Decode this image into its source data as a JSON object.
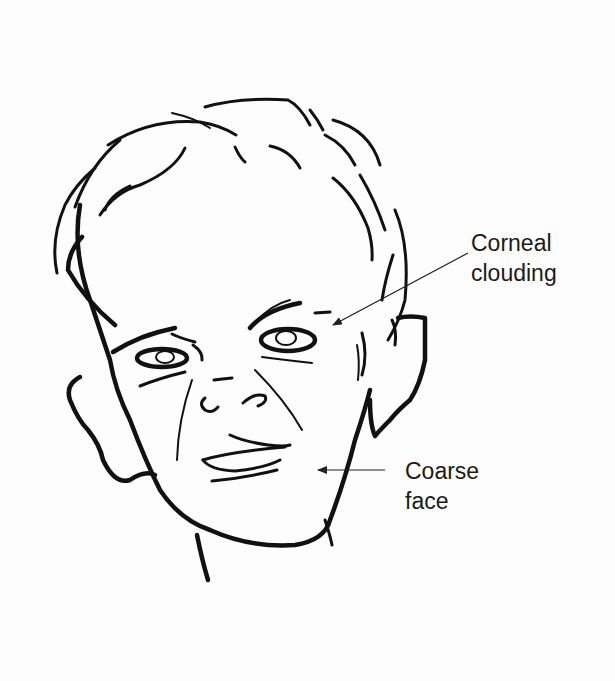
{
  "figure": {
    "annotations": [
      {
        "id": "corneal-clouding",
        "text": "Corneal\nclouding",
        "arrow_from": [
          468,
          253
        ],
        "arrow_to": [
          333,
          325
        ]
      },
      {
        "id": "coarse-face",
        "text": "Coarse\nface",
        "arrow_from": [
          385,
          470
        ],
        "arrow_to": [
          318,
          470
        ]
      }
    ],
    "colors": {
      "ink": "#111111",
      "background": "#fdfdfd",
      "label": "#1a1a1a"
    }
  }
}
